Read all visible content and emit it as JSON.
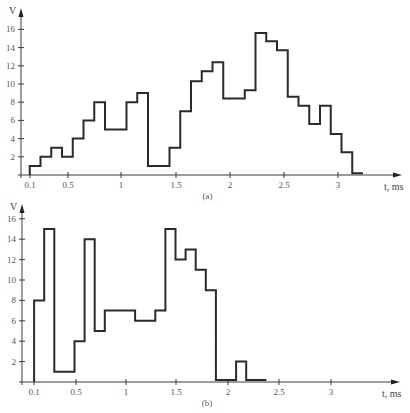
{
  "chart_data": [
    {
      "type": "line",
      "subtype": "step",
      "caption": "(a)",
      "xlabel": "t, ms",
      "ylabel": "V",
      "x_ticks": [
        "0.1",
        "0.5",
        "1",
        "1.5",
        "2",
        "2.5",
        "3"
      ],
      "y_ticks": [
        "2",
        "4",
        "6",
        "8",
        "10",
        "12",
        "14",
        "16"
      ],
      "xlim": [
        0,
        3.6
      ],
      "ylim": [
        0,
        17
      ],
      "grid": false,
      "steps": [
        {
          "t0": 0.1,
          "t1": 0.2,
          "v": 1
        },
        {
          "t0": 0.2,
          "t1": 0.3,
          "v": 2
        },
        {
          "t0": 0.3,
          "t1": 0.4,
          "v": 3
        },
        {
          "t0": 0.4,
          "t1": 0.5,
          "v": 2
        },
        {
          "t0": 0.5,
          "t1": 0.6,
          "v": 4
        },
        {
          "t0": 0.6,
          "t1": 0.7,
          "v": 6
        },
        {
          "t0": 0.7,
          "t1": 0.8,
          "v": 8
        },
        {
          "t0": 0.8,
          "t1": 1.0,
          "v": 5
        },
        {
          "t0": 1.0,
          "t1": 1.1,
          "v": 8
        },
        {
          "t0": 1.1,
          "t1": 1.2,
          "v": 9
        },
        {
          "t0": 1.2,
          "t1": 1.4,
          "v": 1
        },
        {
          "t0": 1.4,
          "t1": 1.5,
          "v": 3
        },
        {
          "t0": 1.5,
          "t1": 1.6,
          "v": 7
        },
        {
          "t0": 1.6,
          "t1": 1.7,
          "v": 10.3
        },
        {
          "t0": 1.7,
          "t1": 1.8,
          "v": 11.4
        },
        {
          "t0": 1.8,
          "t1": 1.9,
          "v": 12.4
        },
        {
          "t0": 1.9,
          "t1": 2.1,
          "v": 8.4
        },
        {
          "t0": 2.1,
          "t1": 2.2,
          "v": 9.3
        },
        {
          "t0": 2.2,
          "t1": 2.3,
          "v": 15.6
        },
        {
          "t0": 2.3,
          "t1": 2.4,
          "v": 14.7
        },
        {
          "t0": 2.4,
          "t1": 2.5,
          "v": 13.7
        },
        {
          "t0": 2.5,
          "t1": 2.6,
          "v": 8.6
        },
        {
          "t0": 2.6,
          "t1": 2.7,
          "v": 7.6
        },
        {
          "t0": 2.7,
          "t1": 2.8,
          "v": 5.6
        },
        {
          "t0": 2.8,
          "t1": 2.9,
          "v": 7.6
        },
        {
          "t0": 2.9,
          "t1": 3.0,
          "v": 4.5
        },
        {
          "t0": 3.0,
          "t1": 3.1,
          "v": 2.5
        },
        {
          "t0": 3.1,
          "t1": 3.2,
          "v": 0.2
        }
      ]
    },
    {
      "type": "line",
      "subtype": "step",
      "caption": "(b)",
      "xlabel": "t, ms",
      "ylabel": "V",
      "x_ticks": [
        "0.1",
        "0.5",
        "1",
        "1.5",
        "2",
        "2.5",
        "3"
      ],
      "y_ticks": [
        "2",
        "4",
        "6",
        "8",
        "10",
        "12",
        "14",
        "16"
      ],
      "xlim": [
        0,
        3.6
      ],
      "ylim": [
        0,
        17
      ],
      "grid": false,
      "steps": [
        {
          "t0": 0.1,
          "t1": 0.2,
          "v": 8
        },
        {
          "t0": 0.2,
          "t1": 0.3,
          "v": 15
        },
        {
          "t0": 0.3,
          "t1": 0.5,
          "v": 1
        },
        {
          "t0": 0.5,
          "t1": 0.6,
          "v": 4
        },
        {
          "t0": 0.6,
          "t1": 0.7,
          "v": 14
        },
        {
          "t0": 0.7,
          "t1": 0.8,
          "v": 5
        },
        {
          "t0": 0.8,
          "t1": 1.1,
          "v": 7
        },
        {
          "t0": 1.1,
          "t1": 1.3,
          "v": 6
        },
        {
          "t0": 1.3,
          "t1": 1.4,
          "v": 7
        },
        {
          "t0": 1.4,
          "t1": 1.5,
          "v": 15
        },
        {
          "t0": 1.5,
          "t1": 1.6,
          "v": 12
        },
        {
          "t0": 1.6,
          "t1": 1.7,
          "v": 13
        },
        {
          "t0": 1.7,
          "t1": 1.8,
          "v": 11
        },
        {
          "t0": 1.8,
          "t1": 1.9,
          "v": 9
        },
        {
          "t0": 1.9,
          "t1": 2.1,
          "v": 0.2
        },
        {
          "t0": 2.1,
          "t1": 2.2,
          "v": 2
        },
        {
          "t0": 2.2,
          "t1": 2.4,
          "v": 0.2
        }
      ]
    }
  ],
  "layout": {
    "panels": [
      {
        "origin_x": 21,
        "origin_y": 175,
        "x_scale": 107.5,
        "x_offset": 19,
        "y_scale": 9.1,
        "axis_top": 8,
        "axis_right": 402,
        "caption_y": 199,
        "tick_x": [
          30,
          68,
          121,
          176,
          230,
          284,
          338
        ]
      },
      {
        "origin_x": 22,
        "origin_y": 382,
        "x_scale": 101,
        "x_offset": 24,
        "y_scale": 10.2,
        "axis_top": 204,
        "axis_right": 400,
        "caption_y": 406,
        "tick_x": [
          34,
          76,
          126,
          176,
          228,
          279,
          331
        ]
      }
    ],
    "colors": {
      "trace": "#2a2a2a",
      "axis": "#3a3a3a",
      "text": "#555555"
    }
  }
}
